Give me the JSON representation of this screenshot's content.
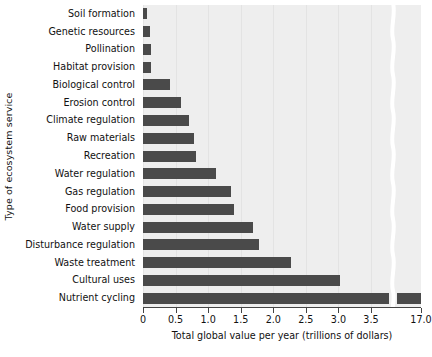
{
  "chart_data": {
    "type": "bar",
    "orientation": "horizontal",
    "title": "",
    "xlabel": "Total global value per year (trillions of dollars)",
    "ylabel": "Type of ecosystem service",
    "categories": [
      "Soil formation",
      "Genetic resources",
      "Pollination",
      "Habitat provision",
      "Biological control",
      "Erosion control",
      "Climate regulation",
      "Raw materials",
      "Recreation",
      "Water regulation",
      "Gas regulation",
      "Food provision",
      "Water supply",
      "Disturbance regulation",
      "Waste treatment",
      "Cultural uses",
      "Nutrient cycling"
    ],
    "values": [
      0.06,
      0.11,
      0.12,
      0.12,
      0.42,
      0.58,
      0.7,
      0.78,
      0.82,
      1.12,
      1.35,
      1.39,
      1.69,
      1.78,
      2.27,
      3.02,
      17.1
    ],
    "xticks": [
      0,
      0.5,
      1.0,
      1.5,
      2.0,
      2.5,
      3.0,
      3.5,
      17.0
    ],
    "xtick_labels": [
      "0",
      "0.5",
      "1.0",
      "1.5",
      "2.0",
      "2.5",
      "3.0",
      "3.5",
      "17.0"
    ],
    "xlim": [
      0,
      17.0
    ],
    "axis_break": {
      "present": true,
      "after_value": 3.5,
      "resume_value": 17.0,
      "style": "wavy-white-band"
    },
    "grid": "vertical-faint",
    "legend": "none",
    "colors": {
      "bar": "#4a4a4a",
      "plot_background": "#eeeeee",
      "page_background": "#ffffff",
      "gridline": "#e3e3e3",
      "axis": "#444444",
      "text": "#111111"
    }
  }
}
